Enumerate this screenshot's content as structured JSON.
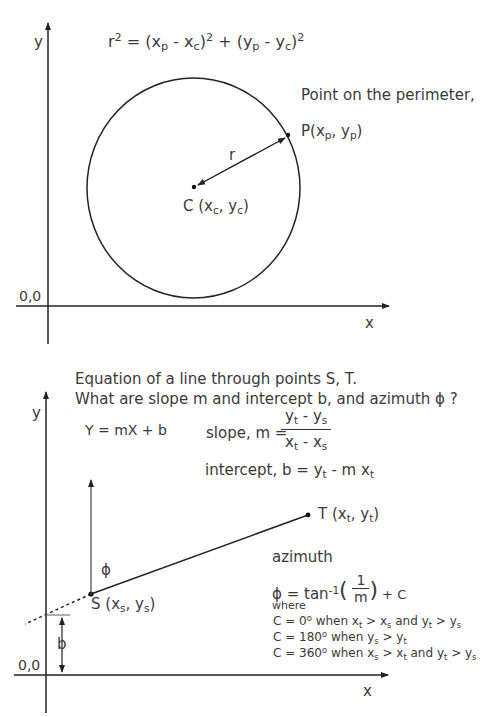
{
  "diagram1": {
    "equation_lhs": "r",
    "equation_lhs_exp": "2",
    "equation_rhs_parts": [
      "= (x",
      "p",
      " - x",
      "c",
      ")",
      "2",
      " + (y",
      "p",
      " - y",
      "c",
      ")",
      "2"
    ],
    "point_label_title": "Point on the perimeter,",
    "point_label": {
      "prefix": "P(x",
      "sub1": "p",
      "mid": ", y",
      "sub2": "p",
      "suffix": ")"
    },
    "center_label": {
      "prefix": "C (x",
      "sub1": "c",
      "mid": ", y",
      "sub2": "c",
      "suffix": ")"
    },
    "radius_label": "r",
    "origin_label": "0,0",
    "x_axis_label": "x",
    "y_axis_label": "y"
  },
  "diagram2": {
    "title_line1": "Equation of a line through points S, T.",
    "title_line2": "What are slope m and intercept b, and azimuth ϕ ?",
    "line_equation": "Y = mX + b",
    "slope_label": "slope, m =",
    "slope_num": {
      "a": "y",
      "a_sub": "t",
      "op": " - y",
      "b_sub": "s"
    },
    "slope_den": {
      "a": "x",
      "a_sub": "t",
      "op": " - x",
      "b_sub": "s"
    },
    "intercept": {
      "prefix": "intercept, b = y",
      "sub1": "t",
      "mid": " - m x",
      "sub2": "t"
    },
    "point_t": {
      "prefix": "T (x",
      "sub1": "t",
      "mid": ", y",
      "sub2": "t",
      "suffix": ")"
    },
    "point_s": {
      "prefix": "S (x",
      "sub1": "s",
      "mid": ", y",
      "sub2": "s",
      "suffix": ")"
    },
    "phi_label": "ϕ",
    "b_label": "b",
    "azimuth_title": "azimuth",
    "azimuth_formula": {
      "lhs": "ϕ = tan",
      "exp": "-1",
      "open": "(",
      "num": "1",
      "den": "m",
      "close": ")",
      "tail": " + C"
    },
    "where_label": "where",
    "conditions": [
      {
        "text": "C = 0",
        "deg": "o",
        "rest1": " when x",
        "s1": "t",
        "rest2": " > x",
        "s2": "s",
        "rest3": " and y",
        "s3": "t",
        "rest4": " > y",
        "s4": "s"
      },
      {
        "text": "C = 180",
        "deg": "o",
        "rest1": " when y",
        "s1": "s",
        "rest2": " > y",
        "s2": "t",
        "rest3": "",
        "s3": "",
        "rest4": "",
        "s4": ""
      },
      {
        "text": "C = 360",
        "deg": "o",
        "rest1": " when x",
        "s1": "s",
        "rest2": " > x",
        "s2": "t",
        "rest3": " and y",
        "s3": "t",
        "rest4": " > y",
        "s4": "s"
      }
    ],
    "origin_label": "0,0",
    "x_axis_label": "x",
    "y_axis_label": "y"
  }
}
